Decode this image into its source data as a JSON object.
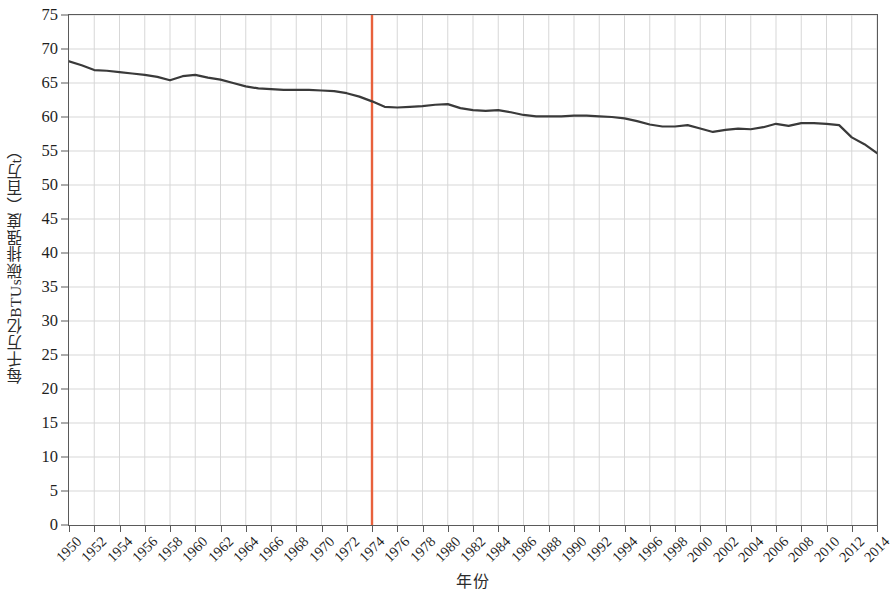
{
  "chart_data": {
    "type": "line",
    "title": "",
    "xlabel": "年份",
    "ylabel": "每千万亿BTUs碳排强度（百万t）",
    "xlim": [
      1950,
      2014
    ],
    "ylim": [
      0,
      75
    ],
    "ytick_step": 5,
    "xtick_step": 2,
    "grid": true,
    "legend": "none",
    "line_color": "#3a3a3a",
    "line_width": 2.2,
    "marker_line": {
      "name": "1974-marker",
      "x": 1974,
      "color": "#e8613c",
      "label": ""
    },
    "ylabels": [
      "0",
      "5",
      "10",
      "15",
      "20",
      "25",
      "30",
      "35",
      "40",
      "45",
      "50",
      "55",
      "60",
      "65",
      "70",
      "75"
    ],
    "yvalues": [
      0,
      5,
      10,
      15,
      20,
      25,
      30,
      35,
      40,
      45,
      50,
      55,
      60,
      65,
      70,
      75
    ],
    "xlabels": [
      "1950",
      "1952",
      "1954",
      "1956",
      "1958",
      "1960",
      "1962",
      "1964",
      "1966",
      "1968",
      "1970",
      "1972",
      "1974",
      "1976",
      "1978",
      "1980",
      "1982",
      "1984",
      "1986",
      "1988",
      "1990",
      "1992",
      "1994",
      "1996",
      "1998",
      "2000",
      "2002",
      "2004",
      "2006",
      "2008",
      "2010",
      "2012",
      "2014"
    ],
    "xvalues": [
      1950,
      1952,
      1954,
      1956,
      1958,
      1960,
      1962,
      1964,
      1966,
      1968,
      1970,
      1972,
      1974,
      1976,
      1978,
      1980,
      1982,
      1984,
      1986,
      1988,
      1990,
      1992,
      1994,
      1996,
      1998,
      2000,
      2002,
      2004,
      2006,
      2008,
      2010,
      2012,
      2014
    ],
    "series": [
      {
        "name": "碳排强度",
        "x": [
          1950,
          1951,
          1952,
          1953,
          1954,
          1955,
          1956,
          1957,
          1958,
          1959,
          1960,
          1961,
          1962,
          1963,
          1964,
          1965,
          1966,
          1967,
          1968,
          1969,
          1970,
          1971,
          1972,
          1973,
          1974,
          1975,
          1976,
          1977,
          1978,
          1979,
          1980,
          1981,
          1982,
          1983,
          1984,
          1985,
          1986,
          1987,
          1988,
          1989,
          1990,
          1991,
          1992,
          1993,
          1994,
          1995,
          1996,
          1997,
          1998,
          1999,
          2000,
          2001,
          2002,
          2003,
          2004,
          2005,
          2006,
          2007,
          2008,
          2009,
          2010,
          2011,
          2012,
          2013,
          2014
        ],
        "values": [
          68.2,
          67.6,
          66.9,
          66.8,
          66.6,
          66.4,
          66.2,
          65.9,
          65.4,
          66.0,
          66.2,
          65.8,
          65.5,
          65.0,
          64.5,
          64.2,
          64.1,
          64.0,
          64.0,
          64.0,
          63.9,
          63.8,
          63.5,
          63.0,
          62.3,
          61.5,
          61.4,
          61.5,
          61.6,
          61.8,
          61.9,
          61.3,
          61.0,
          60.9,
          61.0,
          60.7,
          60.3,
          60.1,
          60.1,
          60.1,
          60.2,
          60.2,
          60.1,
          60.0,
          59.8,
          59.4,
          58.9,
          58.6,
          58.6,
          58.8,
          58.3,
          57.8,
          58.1,
          58.3,
          58.2,
          58.5,
          59.0,
          58.7,
          59.1,
          59.1,
          59.0,
          58.8,
          57.0,
          56.0,
          54.7
        ]
      }
    ]
  }
}
